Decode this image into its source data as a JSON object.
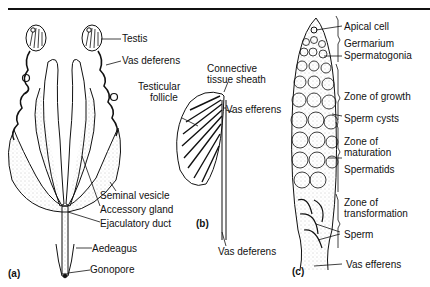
{
  "figure": {
    "panels": [
      {
        "id": "a",
        "marker": "(a)",
        "labels": [
          "Testis",
          "Vas deferens",
          "Seminal vesicle",
          "Accessory gland",
          "Ejaculatory duct",
          "Aedeagus",
          "Gonopore"
        ]
      },
      {
        "id": "b",
        "marker": "(b)",
        "labels": [
          "Testicular follicle",
          "Connective tissue sheath",
          "Vas efferens",
          "Vas deferens"
        ]
      },
      {
        "id": "c",
        "marker": "(c)",
        "labels": [
          "Apical cell",
          "Germarium",
          "Spermatogonia",
          "Zone of growth",
          "Sperm cysts",
          "Zone of maturation",
          "Spermatids",
          "Zone of transformation",
          "Sperm",
          "Vas efferens"
        ]
      }
    ]
  },
  "labels": {
    "a": {
      "marker": "(a)",
      "testis": "Testis",
      "vas_deferens": "Vas deferens",
      "seminal_vesicle": "Seminal vesicle",
      "accessory_gland": "Accessory gland",
      "ejaculatory_duct": "Ejaculatory duct",
      "aedeagus": "Aedeagus",
      "gonopore": "Gonopore"
    },
    "b": {
      "marker": "(b)",
      "testicular_follicle_1": "Testicular",
      "testicular_follicle_2": "follicle",
      "sheath_1": "Connective",
      "sheath_2": "tissue sheath",
      "vas_efferens": "Vas efferens",
      "vas_deferens": "Vas deferens"
    },
    "c": {
      "marker": "(c)",
      "apical_cell": "Apical cell",
      "germarium": "Germarium",
      "spermatogonia": "Spermatogonia",
      "zone_growth": "Zone of growth",
      "sperm_cysts": "Sperm cysts",
      "zone_maturation_1": "Zone of",
      "zone_maturation_2": "maturation",
      "spermatids": "Spermatids",
      "zone_transformation_1": "Zone of",
      "zone_transformation_2": "transformation",
      "sperm": "Sperm",
      "vas_efferens": "Vas efferens"
    }
  }
}
